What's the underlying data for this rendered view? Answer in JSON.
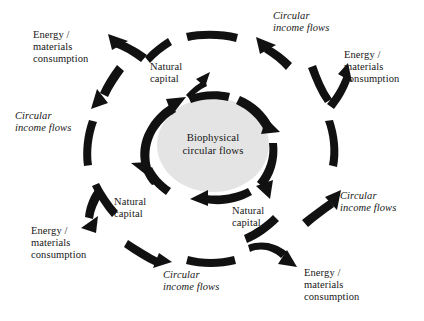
{
  "diagram": {
    "center": {
      "label": "Biophysical\ncircular flows",
      "fill_color": "#e4e4e4",
      "text_color": "#171717"
    },
    "colors": {
      "arrow": "#111111",
      "background": "#ffffff",
      "text": "#171717",
      "ellipse_fill": "#e4e4e4"
    },
    "inner_ring": {
      "description": "Thick clockwise arc arrows encircling the central ellipse",
      "segment_count": 5,
      "direction": "clockwise"
    },
    "outer_ring": {
      "description": "Dashed ring of short arc segments with interleaved arrows",
      "segment_count": 8,
      "direction": "counter-clockwise"
    },
    "inner_labels": [
      {
        "name": "natural-capital-top",
        "text": "Natural\ncapital",
        "style": "regular"
      },
      {
        "name": "natural-capital-left",
        "text": "Natural\ncapital",
        "style": "regular"
      },
      {
        "name": "natural-capital-right",
        "text": "Natural\ncapital",
        "style": "regular"
      }
    ],
    "outer_labels": [
      {
        "name": "energy-materials-top-left",
        "text": "Energy /\nmaterials\nconsumption",
        "style": "regular"
      },
      {
        "name": "circular-income-top-right",
        "text": "Circular\nincome flows",
        "style": "italic"
      },
      {
        "name": "energy-materials-right-top",
        "text": "Energy /\nmaterials\nconsumption",
        "style": "regular"
      },
      {
        "name": "circular-income-left",
        "text": "Circular\nincome flows",
        "style": "italic"
      },
      {
        "name": "circular-income-right",
        "text": "Circular\nincome flows",
        "style": "italic"
      },
      {
        "name": "energy-materials-bottom-left",
        "text": "Energy /\nmaterials\nconsumption",
        "style": "regular"
      },
      {
        "name": "circular-income-bottom",
        "text": "Circular\nincome flows",
        "style": "italic"
      },
      {
        "name": "energy-materials-bottom-right",
        "text": "Energy /\nmaterials\nconsumption",
        "style": "regular"
      }
    ]
  }
}
